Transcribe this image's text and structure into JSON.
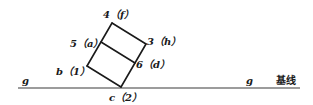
{
  "diagram": {
    "baseline": {
      "left_label": "g",
      "right_label": "g",
      "name": "基线"
    },
    "points": {
      "top": "4（f）",
      "right_top": "3（h）",
      "left_mid": "5（a）",
      "right_mid": "6（d）",
      "left_bottom": "b（1）",
      "bottom": "c（2）"
    },
    "colors": {
      "line": "#1a1a1a",
      "baseline": "#3a3a3a",
      "background": "#ffffff"
    }
  }
}
